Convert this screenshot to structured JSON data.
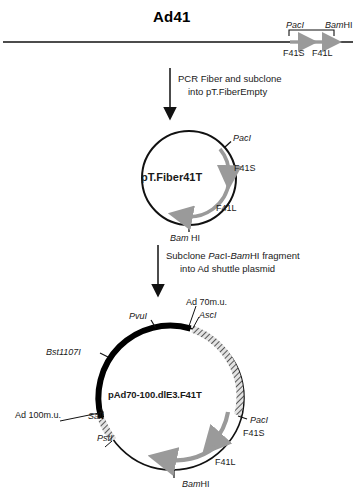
{
  "figure": {
    "title": "Ad41",
    "genome": {
      "left_site": "PacI",
      "right_site": "BamHI",
      "gene_left": "F41S",
      "gene_right": "F41L"
    },
    "steps": [
      {
        "line1": "PCR Fiber and subclone",
        "line2": "into pT.FiberEmpty"
      },
      {
        "line1": "Subclone PacI-BamHI fragment",
        "line2": "into Ad shuttle plasmid"
      }
    ],
    "plasmid_1": {
      "name": "pT.Fiber41T",
      "sites": {
        "paci": "PacI",
        "f41s": "F41S",
        "f41l": "F41L",
        "bamhi": "Bam HI"
      }
    },
    "plasmid_2": {
      "name": "pAd70-100.dlE3.F41T",
      "sites": {
        "ad70": "Ad 70m.u.",
        "asci": "AscI",
        "pvui": "PvuI",
        "bst1107i": "Bst1107I",
        "ad100": "Ad 100m.u.",
        "sali": "SalI",
        "psti": "PstI",
        "paci": "PacI",
        "f41s": "F41S",
        "f41l": "F41L",
        "bamhi": "BamHI"
      }
    },
    "colors": {
      "line": "#111111",
      "arrow_gray": "#9a9a9a",
      "hatch": "#202020"
    }
  }
}
